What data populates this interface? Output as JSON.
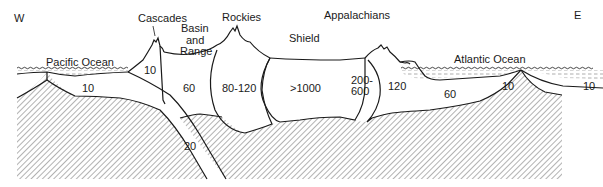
{
  "diagram": {
    "type": "geologic cross-section",
    "directions": {
      "west": "W",
      "east": "E"
    },
    "features": {
      "pacific_ocean": "Pacific Ocean",
      "cascades": "Cascades",
      "basin_and_range": [
        "Basin",
        "and",
        "Range"
      ],
      "rockies": "Rockies",
      "shield": "Shield",
      "appalachians": "Appalachians",
      "atlantic_ocean": "Atlantic Ocean"
    },
    "thickness_labels": {
      "pacific_plate": "10",
      "cascades_wedge": "10",
      "basin_and_range": "60",
      "rockies": "80-120",
      "shield": ">1000",
      "appalachians_top": "200-",
      "appalachians_bottom": "600",
      "coastal_plain": "120",
      "atlantic_margin": "60",
      "atlantic_plate_west": "10",
      "atlantic_plate_east": "10",
      "subducting_slab": "20"
    },
    "colors": {
      "ink": "#1a1a1a",
      "background": "#ffffff",
      "hatch": "#555555",
      "water": "#888888"
    }
  }
}
